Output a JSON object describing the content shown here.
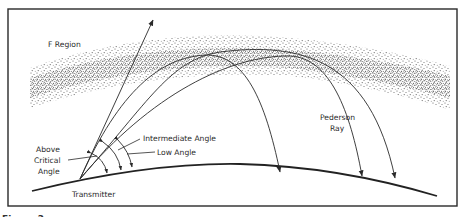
{
  "figure": {
    "type": "ionospheric propagation diagram",
    "colors": {
      "ink": "#2a2a2a",
      "background": "#ffffff",
      "stipple": "#3a3a3a"
    },
    "caption_partial": "Figure 2-"
  },
  "labels": {
    "f_region": "F Region",
    "pederson_line1": "Pederson",
    "pederson_line2": "Ray",
    "above_critical_line1": "Above",
    "above_critical_line2": "Critical",
    "above_critical_line3": "Angle",
    "intermediate_angle": "Intermediate Angle",
    "low_angle": "Low Angle",
    "transmitter": "Transmitter"
  },
  "rays": [
    {
      "name": "above-critical-angle-ray",
      "behavior": "escapes through F region"
    },
    {
      "name": "intermediate-angle-ray",
      "behavior": "refracted back to Earth"
    },
    {
      "name": "low-angle-ray",
      "behavior": "refracted back to Earth"
    },
    {
      "name": "pederson-ray",
      "behavior": "travels within F region then returns far away"
    }
  ]
}
